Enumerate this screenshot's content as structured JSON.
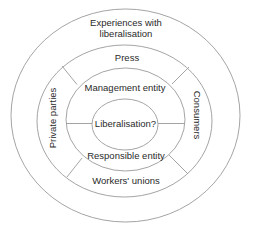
{
  "diagram": {
    "colors": {
      "stroke": "#9a9a9a",
      "text": "#2a2a2a",
      "background": "#ffffff"
    },
    "outer_ring": {
      "label_line1": "Experiences with",
      "label_line2": "liberalisation"
    },
    "middle_ring": {
      "top": "Press",
      "left": "Private parties",
      "right": "Consumers",
      "bottom": "Workers' unions"
    },
    "inner_ring": {
      "top": "Management entity",
      "bottom": "Responsible entity"
    },
    "core": {
      "label": "Liberalisation?"
    }
  }
}
